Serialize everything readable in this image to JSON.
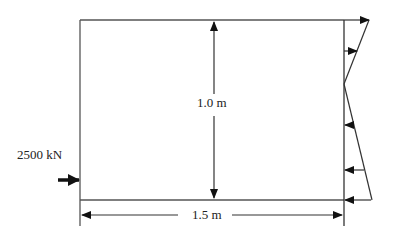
{
  "diagram": {
    "type": "free-body / pressure distribution on rectangular block",
    "labels": {
      "height": "1.0 m",
      "width": "1.5 m",
      "force": "2500 kN"
    },
    "colors": {
      "line": "#555555",
      "arrow": "#111111",
      "text": "#222222",
      "background": "#ffffff"
    },
    "block": {
      "x": 80,
      "y": 20,
      "w": 264,
      "h": 180
    },
    "pressure_distribution": {
      "shape": "linear, tension at top and compression at bottom",
      "top_tip": [
        369,
        20
      ],
      "zero_point": [
        344,
        84
      ],
      "bottom_tip": [
        372,
        200
      ],
      "arrows": [
        {
          "y": 20,
          "direction": "right"
        },
        {
          "y": 51,
          "direction": "right"
        },
        {
          "y": 125,
          "direction": "left"
        },
        {
          "y": 170,
          "direction": "left"
        },
        {
          "y": 200,
          "direction": "left"
        }
      ]
    }
  }
}
